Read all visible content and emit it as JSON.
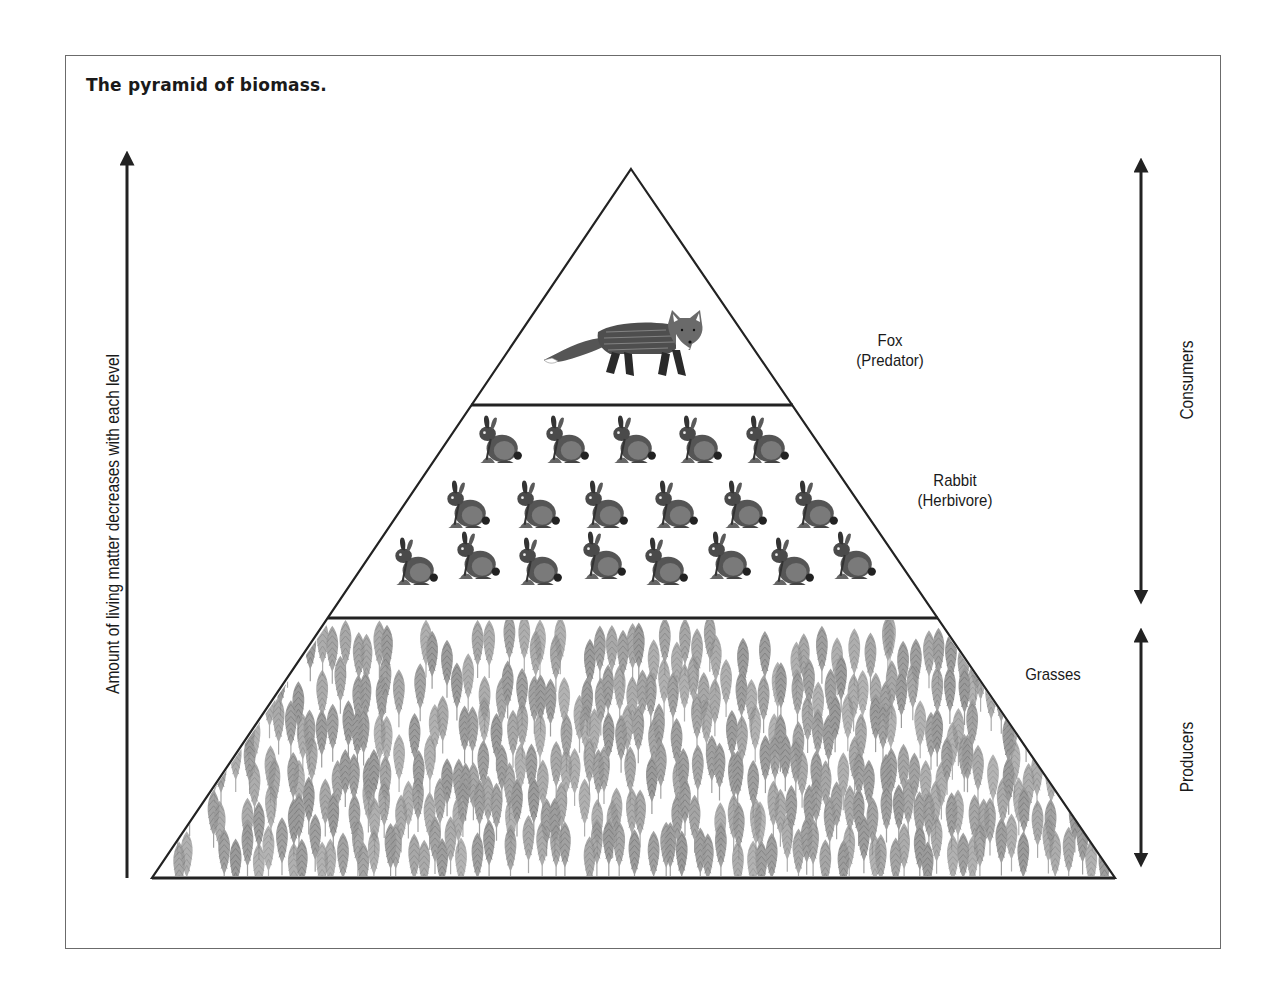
{
  "title": "The pyramid of biomass.",
  "axis": {
    "left_label": "Amount of living matter decreases with each level",
    "right_consumers": "Consumers",
    "right_producers": "Producers"
  },
  "levels": [
    {
      "id": "predator",
      "name": "Fox",
      "role": "(Predator)",
      "icon": "fox-icon",
      "count": 1
    },
    {
      "id": "herbivore",
      "name": "Rabbit",
      "role": "(Herbivore)",
      "icon": "rabbit-icon",
      "count": 19,
      "rows": [
        5,
        6,
        8
      ]
    },
    {
      "id": "producer",
      "name": "Grasses",
      "role": "",
      "icon": "grass-icon"
    }
  ],
  "colors": {
    "line": "#222222",
    "frame": "#6b6b6b",
    "grass": "#8f8f8f",
    "animal": "#3a3a3a"
  }
}
